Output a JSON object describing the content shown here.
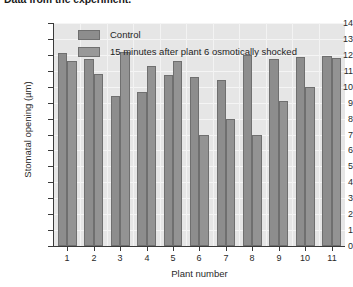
{
  "chart_data": {
    "type": "bar",
    "title": "Data from the experiment.",
    "xlabel": "Plant number",
    "ylabel": "Stomatal opening (µm)",
    "categories": [
      "1",
      "2",
      "3",
      "4",
      "5",
      "6",
      "7",
      "8",
      "9",
      "10",
      "11"
    ],
    "ylim": [
      0,
      14
    ],
    "yticks": [
      "0",
      "1",
      "2",
      "3",
      "4",
      "5",
      "6",
      "7",
      "8",
      "9",
      "10",
      "11",
      "12",
      "13",
      "14"
    ],
    "grid": true,
    "legend_position": "top-left-inside",
    "series": [
      {
        "name": "Control",
        "color": "#8d8d8d",
        "values": [
          12.1,
          11.75,
          9.4,
          9.7,
          10.75,
          10.6,
          10.4,
          12.0,
          11.75,
          11.85,
          11.95
        ]
      },
      {
        "name": "15 minutes after plant 6 osmotically shocked",
        "color": "#939393",
        "values": [
          11.6,
          10.8,
          12.2,
          11.3,
          11.6,
          7.0,
          8.0,
          7.0,
          9.1,
          10.0,
          11.8
        ]
      }
    ]
  },
  "colors": {
    "plot_background": "#e6e6e6",
    "axis": "#3a3a3a",
    "gridline": "#f4f4f4",
    "bar_border": "#6f6f6f"
  }
}
